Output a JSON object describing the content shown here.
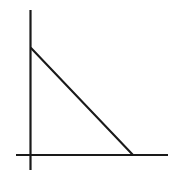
{
  "figure": {
    "panel_label": ")",
    "panel_label_note": "cropped-parenthesis-at-left-edge",
    "background_color": "#ffffff",
    "ink_color": "#1a1a1a",
    "label_color": "#9a9a9a",
    "width": 174,
    "height": 174
  },
  "axes": {
    "y_axis": {
      "name": "vertical-axis",
      "x": 30.5,
      "y_top": 10,
      "y_bottom": 170,
      "stroke_width": 2.2,
      "color": "#1a1a1a",
      "tick_labels": [],
      "label": ""
    },
    "x_axis": {
      "name": "horizontal-axis",
      "y": 155,
      "x_left": 16,
      "x_right": 168,
      "stroke_width": 2.2,
      "color": "#1a1a1a",
      "tick_labels": [],
      "label": ""
    },
    "origin": {
      "x": 30.5,
      "y": 155
    }
  },
  "chart_data": {
    "type": "line",
    "title": "",
    "xlabel": "",
    "ylabel": "",
    "grid": false,
    "legend": null,
    "annotations": [],
    "axis_tick_labels": {
      "x": [],
      "y": []
    },
    "xlim": [
      0,
      1.35
    ],
    "ylim": [
      0,
      1.45
    ],
    "series": [
      {
        "name": "descending-line",
        "color": "#1a1a1a",
        "stroke_width": 2.1,
        "description": "straight line with negative slope from y-intercept down to x-axis",
        "x": [
          0,
          1
        ],
        "y": [
          1,
          0
        ],
        "pixel_points": [
          {
            "x": 31,
            "y": 48
          },
          {
            "x": 133,
            "y": 155
          }
        ],
        "y_intercept_pixel": 48,
        "x_intercept_pixel": 133
      }
    ]
  }
}
